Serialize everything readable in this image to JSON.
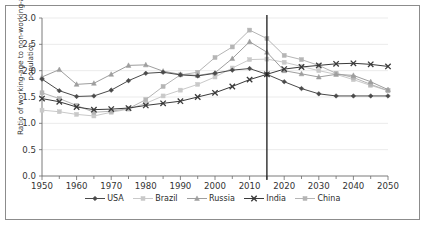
{
  "chart_data": {
    "type": "line",
    "title": "",
    "xlabel": "",
    "ylabel": "Ratio of working-age to non-working-age population",
    "xlim": [
      1950,
      2050
    ],
    "ylim": [
      0.0,
      3.0
    ],
    "ytick_step": 0.5,
    "xtick_step": 5,
    "xtick_label_step": 10,
    "grid": "horizontal",
    "legend_position": "bottom",
    "x": [
      1950,
      1955,
      1960,
      1965,
      1970,
      1975,
      1980,
      1985,
      1990,
      1995,
      2000,
      2005,
      2010,
      2015,
      2020,
      2025,
      2030,
      2035,
      2040,
      2045,
      2050
    ],
    "xtick_labels": [
      "1950",
      "1960",
      "1970",
      "1980",
      "1990",
      "2000",
      "2010",
      "2020",
      "2030",
      "2040",
      "2050"
    ],
    "ytick_labels": [
      "0.0",
      "0.5",
      "1.0",
      "1.5",
      "2.0",
      "2.5",
      "3.0"
    ],
    "annotations": [
      {
        "type": "vertical-line",
        "x": 2015,
        "label": ""
      }
    ],
    "series": [
      {
        "name": "USA",
        "marker": "diamond",
        "color": "#4a4a4a",
        "values": [
          1.84,
          1.62,
          1.51,
          1.52,
          1.63,
          1.81,
          1.95,
          1.97,
          1.92,
          1.9,
          1.95,
          2.01,
          2.04,
          1.93,
          1.79,
          1.66,
          1.56,
          1.52,
          1.52,
          1.52,
          1.52
        ]
      },
      {
        "name": "Brazil",
        "marker": "square",
        "color": "#c9c9c9",
        "values": [
          1.25,
          1.22,
          1.17,
          1.14,
          1.21,
          1.27,
          1.38,
          1.52,
          1.63,
          1.74,
          1.88,
          2.05,
          2.21,
          2.22,
          2.16,
          2.08,
          2.0,
          1.93,
          1.83,
          1.72,
          1.62
        ]
      },
      {
        "name": "Russia",
        "marker": "triangle",
        "color": "#9e9e9e",
        "values": [
          1.88,
          2.02,
          1.74,
          1.76,
          1.93,
          2.1,
          2.11,
          1.99,
          1.93,
          1.91,
          1.96,
          2.23,
          2.55,
          2.35,
          2.0,
          1.94,
          1.88,
          1.93,
          1.91,
          1.79,
          1.64
        ]
      },
      {
        "name": "India",
        "marker": "x",
        "color": "#3a3a3a",
        "values": [
          1.47,
          1.41,
          1.31,
          1.26,
          1.27,
          1.29,
          1.34,
          1.38,
          1.42,
          1.5,
          1.58,
          1.7,
          1.83,
          1.93,
          2.03,
          2.07,
          2.1,
          2.13,
          2.14,
          2.12,
          2.08
        ]
      },
      {
        "name": "China",
        "marker": "square",
        "color": "#b5b5b5",
        "values": [
          1.58,
          1.47,
          1.34,
          1.21,
          1.23,
          1.28,
          1.45,
          1.7,
          1.92,
          1.97,
          2.25,
          2.45,
          2.77,
          2.61,
          2.29,
          2.21,
          2.1,
          1.95,
          1.87,
          1.74,
          1.62
        ]
      }
    ]
  },
  "legend": {
    "items": [
      {
        "label": "USA"
      },
      {
        "label": "Brazil"
      },
      {
        "label": "Russia"
      },
      {
        "label": "India"
      },
      {
        "label": "China"
      }
    ]
  },
  "axis": {
    "y_title": "Ratio of working-age to non-working-age population"
  }
}
